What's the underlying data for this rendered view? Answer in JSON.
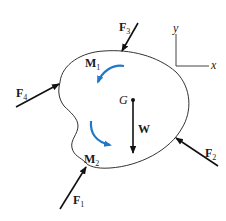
{
  "diagram": {
    "type": "free-body-diagram",
    "colors": {
      "outline": "#333333",
      "force": "#111111",
      "moment": "#1f78c8"
    },
    "axes": {
      "x_label": "x",
      "y_label": "y"
    },
    "center_of_gravity": {
      "label": "G"
    },
    "weight": {
      "label": "W"
    },
    "forces": [
      {
        "id": "F1",
        "main": "F",
        "sub": "1"
      },
      {
        "id": "F2",
        "main": "F",
        "sub": "2"
      },
      {
        "id": "F3",
        "main": "F",
        "sub": "3"
      },
      {
        "id": "F4",
        "main": "F",
        "sub": "4"
      }
    ],
    "moments": [
      {
        "id": "M1",
        "main": "M",
        "sub": "1",
        "direction": "counterclockwise"
      },
      {
        "id": "M2",
        "main": "M",
        "sub": "2",
        "direction": "counterclockwise"
      }
    ]
  }
}
